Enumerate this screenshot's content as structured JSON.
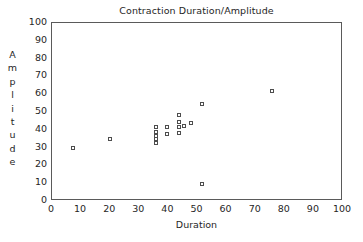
{
  "chart_data": {
    "type": "scatter",
    "title": "Contraction Duration/Amplitude",
    "xlabel": "Duration",
    "ylabel": "Amplitude",
    "xlim": [
      0,
      100
    ],
    "ylim": [
      0,
      100
    ],
    "xticks": [
      0,
      10,
      20,
      30,
      40,
      50,
      60,
      70,
      80,
      90,
      100
    ],
    "yticks": [
      0,
      10,
      20,
      30,
      40,
      50,
      60,
      70,
      80,
      90,
      100
    ],
    "grid": false,
    "legend": "none",
    "marker": "open-square",
    "marker_color": "#4d4d4d",
    "series": [
      {
        "name": "contractions",
        "points": [
          [
            7.6,
            29
          ],
          [
            20.2,
            34
          ],
          [
            36,
            41
          ],
          [
            36,
            38
          ],
          [
            36,
            36
          ],
          [
            36,
            34
          ],
          [
            36,
            32
          ],
          [
            39.8,
            41
          ],
          [
            39.8,
            37
          ],
          [
            44,
            48
          ],
          [
            44,
            44
          ],
          [
            44,
            41
          ],
          [
            44,
            37.5
          ],
          [
            45.6,
            41.5
          ],
          [
            48,
            43
          ],
          [
            52,
            54
          ],
          [
            52,
            9
          ],
          [
            76,
            61
          ]
        ]
      }
    ]
  },
  "axis": {
    "y_label_letters": [
      "A",
      "m",
      "p",
      "l",
      "i",
      "t",
      "u",
      "d",
      "e"
    ]
  }
}
